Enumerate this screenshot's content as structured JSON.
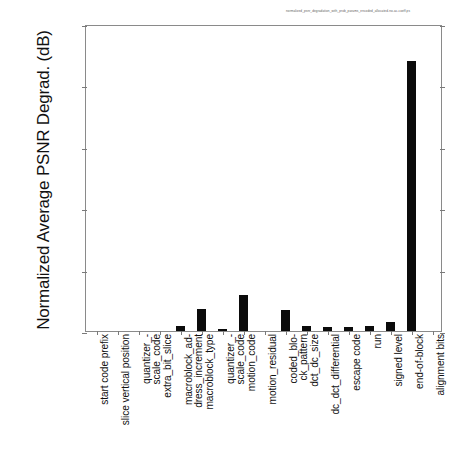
{
  "figure": {
    "caption": "normalized_psnr_degradation_with_prob_params_encoded_allocated-no-ac-coeff.ps",
    "ylabel": "Normalized Average PSNR Degrad. (dB)"
  },
  "axes": {
    "y_ticks": [
      "0.0",
      "0.005",
      "0.01",
      "0.015",
      "0.02",
      "0.025"
    ],
    "y_tick_values": [
      0.0,
      0.005,
      0.01,
      0.015,
      0.02,
      0.025
    ],
    "ylim": [
      0,
      0.025
    ],
    "grid": false
  },
  "chart_data": {
    "type": "bar",
    "title": "",
    "xlabel": "",
    "ylabel": "Normalized Average PSNR Degrad. (dB)",
    "ylim": [
      0,
      0.025
    ],
    "grid": false,
    "legend": null,
    "bar_color": "#0b0b0b",
    "categories": [
      "start code prefix",
      "slice vertical position",
      "quantizer_-\nscale_code",
      "extra_bit_slice",
      "macroblock_ad-\ndress_increment",
      "macroblock_type",
      "quantizer_-\nscale_code",
      "motion_code",
      "motion_residual",
      "coded_blo-\nck_pattern",
      "dct_dc_size",
      "dc_dct_differential",
      "escape code",
      "run",
      "signed level",
      "end-of-block",
      "alignment bits"
    ],
    "values": [
      0.0,
      0.0,
      0.0,
      0.0,
      0.0004,
      0.0018,
      0.0002,
      0.0029,
      0.0,
      0.0017,
      0.0004,
      0.0003,
      0.0003,
      0.0004,
      0.0007,
      0.022,
      0.0
    ]
  }
}
